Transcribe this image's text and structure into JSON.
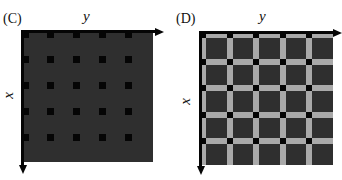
{
  "panels": [
    {
      "id": "C",
      "label": "(C)",
      "x_axis_label": "x",
      "y_axis_label": "y",
      "description": "dark square with a 5x5 lattice of small black square marks",
      "grid_count": 5
    },
    {
      "id": "D",
      "label": "(D)",
      "x_axis_label": "x",
      "y_axis_label": "y",
      "description": "dark square divided by light gray grid bands with black squares at intersections",
      "grid_count": 5
    }
  ],
  "colors": {
    "background": "#ffffff",
    "dark_fill": "#2f2f2f",
    "mark": "#050505",
    "band": "#a9a9a9"
  }
}
